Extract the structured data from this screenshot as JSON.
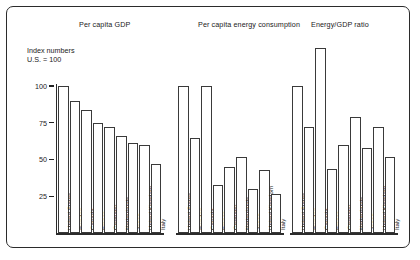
{
  "axis_caption_line1": "Index numbers",
  "axis_caption_line2": "U.S. = 100",
  "tick_labels": [
    "100",
    "75",
    "50",
    "25"
  ],
  "groups": [
    {
      "title": "Per capita GDP"
    },
    {
      "title": "Per capita energy consumption"
    },
    {
      "title": "Energy/GDP ratio"
    }
  ],
  "chart_data": {
    "type": "bar",
    "title": "",
    "xlabel": "",
    "ylabel": "Index numbers U.S. = 100",
    "ylim": [
      0,
      130
    ],
    "yticks": [
      25,
      50,
      75,
      100
    ],
    "grid": false,
    "legend": "none",
    "categories": [
      "United States",
      "Sweden",
      "Canada",
      "France",
      "Germany",
      "Netherlands",
      "Japan",
      "United Kingdom",
      "Italy"
    ],
    "panels": [
      {
        "title": "Per capita GDP",
        "categories": [
          "United States",
          "Sweden",
          "Canada",
          "France",
          "Germany",
          "Netherlands",
          "Japan",
          "United Kingdom",
          "Italy"
        ],
        "values": [
          100,
          90,
          84,
          75,
          72,
          66,
          61,
          60,
          47
        ]
      },
      {
        "title": "Per capita energy consumption",
        "categories": [
          "United States",
          "Sweden",
          "Canada",
          "France",
          "Germany",
          "Netherlands",
          "Japan",
          "United Kingdom",
          "Italy"
        ],
        "values": [
          100,
          65,
          100,
          33,
          45,
          52,
          30,
          43,
          27
        ]
      },
      {
        "title": "Energy/GDP ratio",
        "categories": [
          "United States",
          "Sweden",
          "Canada",
          "France",
          "Germany",
          "Netherlands",
          "Japan",
          "United Kingdom",
          "Italy"
        ],
        "values": [
          100,
          72,
          126,
          44,
          60,
          79,
          58,
          72,
          52
        ]
      }
    ]
  }
}
